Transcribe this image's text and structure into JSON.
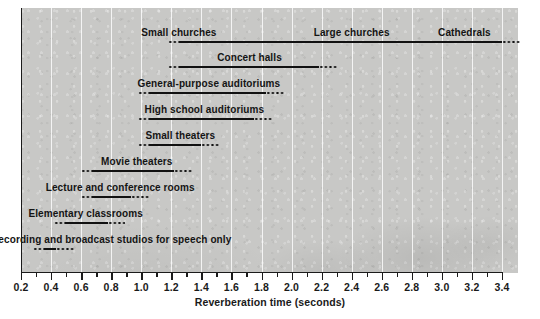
{
  "chart_data": {
    "type": "bar",
    "orientation": "horizontal",
    "title": "",
    "xlabel": "Reverberation time (seconds)",
    "ylabel": "",
    "xlim": [
      0.2,
      3.4
    ],
    "xtick_step": 0.2,
    "minor_tick_step": 0.1,
    "grid": "vertical white gridlines",
    "xticks": [
      "0.2",
      "0.4",
      "0.6",
      "0.8",
      "1.0",
      "1.2",
      "1.4",
      "1.6",
      "1.8",
      "2.0",
      "2.2",
      "2.4",
      "2.6",
      "2.8",
      "3.0",
      "3.2",
      "3.4"
    ],
    "note": "Each category is a range bar: solid segment = typical range, dotted ends = tapering/uncertain extremes",
    "categories": [
      {
        "label": "Small churches",
        "label_center": 1.25,
        "solid_start": 1.25,
        "solid_end": 3.4,
        "dots_start": 1.18,
        "dots_end": 3.52
      },
      {
        "label": "Large churches",
        "label_center": 2.4,
        "shares_bar_with": "Small churches"
      },
      {
        "label": "Cathedrals",
        "label_center": 3.15,
        "shares_bar_with": "Small churches"
      },
      {
        "label": "Concert halls",
        "label_center": 1.72,
        "solid_start": 1.25,
        "solid_end": 2.18,
        "dots_start": 1.18,
        "dots_end": 2.3
      },
      {
        "label": "General-purpose auditoriums",
        "label_center": 1.45,
        "solid_start": 1.05,
        "solid_end": 1.83,
        "dots_start": 0.98,
        "dots_end": 1.95
      },
      {
        "label": "High school auditoriums",
        "label_center": 1.42,
        "solid_start": 1.05,
        "solid_end": 1.75,
        "dots_start": 0.98,
        "dots_end": 1.87
      },
      {
        "label": "Small theaters",
        "label_center": 1.26,
        "solid_start": 1.05,
        "solid_end": 1.4,
        "dots_start": 0.98,
        "dots_end": 1.52
      },
      {
        "label": "Movie theaters",
        "label_center": 0.97,
        "solid_start": 0.67,
        "solid_end": 1.22,
        "dots_start": 0.6,
        "dots_end": 1.34
      },
      {
        "label": "Lecture and conference rooms",
        "label_center": 0.86,
        "solid_start": 0.67,
        "solid_end": 0.93,
        "dots_start": 0.6,
        "dots_end": 1.05
      },
      {
        "label": "Elementary classrooms",
        "label_center": 0.63,
        "solid_start": 0.49,
        "solid_end": 0.78,
        "dots_start": 0.42,
        "dots_end": 0.89
      },
      {
        "label": "Recording and broadcast studios for speech only",
        "label_center": 0.8,
        "solid_start": 0.36,
        "solid_end": 0.43,
        "dots_start": 0.28,
        "dots_end": 0.55
      }
    ]
  },
  "axis": {
    "x_title": "Reverberation time (seconds)",
    "ticks": [
      "0.2",
      "0.4",
      "0.6",
      "0.8",
      "1.0",
      "1.2",
      "1.4",
      "1.6",
      "1.8",
      "2.0",
      "2.2",
      "2.4",
      "2.6",
      "2.8",
      "3.0",
      "3.2",
      "3.4"
    ]
  },
  "labels": {
    "small_churches": "Small churches",
    "large_churches": "Large churches",
    "cathedrals": "Cathedrals",
    "concert_halls": "Concert halls",
    "general_purpose_auditoriums": "General-purpose auditoriums",
    "high_school_auditoriums": "High school auditoriums",
    "small_theaters": "Small theaters",
    "movie_theaters": "Movie theaters",
    "lecture_and_conference_rooms": "Lecture and conference rooms",
    "elementary_classrooms": "Elementary classrooms",
    "recording_studios": "Recording and broadcast studios for speech only"
  },
  "colors": {
    "panel_background": "#c8c8c6",
    "gridline": "#ffffff",
    "bar": "#111111",
    "axis": "#1b1b1b",
    "text": "#141414"
  }
}
